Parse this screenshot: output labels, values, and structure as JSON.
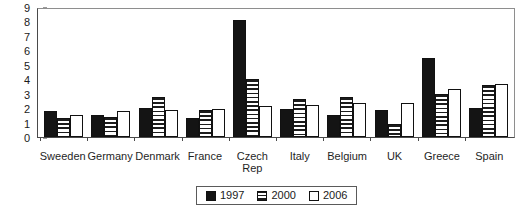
{
  "chart_data": {
    "type": "bar",
    "title": "",
    "subtitle": "",
    "xlabel": "",
    "ylabel": "",
    "ylim": [
      0,
      9
    ],
    "yticks": [
      0,
      1,
      2,
      3,
      4,
      5,
      6,
      7,
      8,
      9
    ],
    "grid": false,
    "legend_position": "bottom-center",
    "categories": [
      "Sweeden",
      "Germany",
      "Denmark",
      "France",
      "Czech\nRep",
      "Italy",
      "Belgium",
      "UK",
      "Greece",
      "Spain"
    ],
    "series": [
      {
        "name": "1997",
        "pattern": "solid-black",
        "color": "#141414",
        "values": [
          1.8,
          1.5,
          2.0,
          1.35,
          8.1,
          1.95,
          1.55,
          1.9,
          5.5,
          2.0
        ]
      },
      {
        "name": "2000",
        "pattern": "horizontal-stripes",
        "color": "#1c1c1c",
        "values": [
          1.3,
          1.4,
          2.75,
          1.85,
          4.0,
          2.6,
          2.75,
          0.9,
          3.0,
          3.6
        ]
      },
      {
        "name": "2006",
        "pattern": "white-fill",
        "color": "#ffffff",
        "values": [
          1.5,
          1.8,
          1.9,
          1.95,
          2.15,
          2.25,
          2.35,
          2.35,
          3.35,
          3.7
        ]
      }
    ]
  }
}
